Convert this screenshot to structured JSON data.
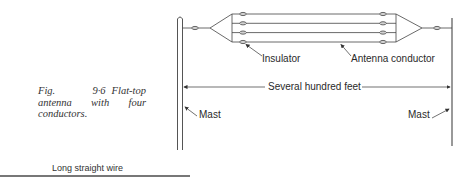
{
  "figure": {
    "number": "Fig. 9·6",
    "caption": "Flat-top antenna with four conductors."
  },
  "labels": {
    "insulator": "Insulator",
    "antenna_conductor": "Antenna conductor",
    "span": "Several hundred feet",
    "mast_left": "Mast",
    "mast_right": "Mast"
  },
  "next_figure": {
    "label": "Long straight wire"
  },
  "diagram": {
    "conductor_count": 4,
    "line_color": "#444444"
  }
}
